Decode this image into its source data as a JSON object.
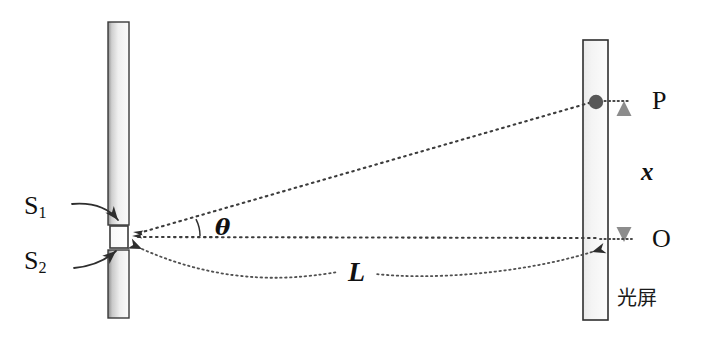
{
  "figure": {
    "kind": "optics-diagram",
    "background_color": "#ffffff",
    "ink_color": "#111111",
    "barrier_fill_light": "#f2f2f2",
    "barrier_fill_dark": "#9a9a9a",
    "barrier_stroke": "#3a3a3a",
    "ray_color": "#3c3c3c",
    "measure_arrow_color": "#8c8c8c",
    "point_dot_color": "#555555"
  },
  "labels": {
    "slit_upper": "S",
    "slit_upper_sub": "1",
    "slit_lower": "S",
    "slit_lower_sub": "2",
    "angle": "θ",
    "distance_screen": "L",
    "fringe_separation": "x",
    "point_bright": "P",
    "point_center": "O",
    "screen_name": "光屏"
  },
  "elements": {
    "barrier": {
      "name": "double-slit-barrier",
      "x_left": 108,
      "x_right": 129,
      "top": 22,
      "bottom": 318,
      "slit_gap_top": 225,
      "slit_gap_bottom": 250
    },
    "screen": {
      "name": "observation-screen",
      "x_left": 583,
      "x_right": 608,
      "top": 40,
      "bottom": 320
    },
    "source_point": {
      "x": 133,
      "y": 237
    },
    "point_P": {
      "x": 596,
      "y": 102
    },
    "point_O": {
      "x": 596,
      "y": 239
    },
    "x_arrow": {
      "x": 624,
      "y_top": 104,
      "y_bottom": 238
    },
    "L_arc": {
      "x_start": 136,
      "y_start": 246,
      "x_end": 600,
      "y_end": 246,
      "sag": 32
    }
  },
  "geometry_notes": {
    "theta_label_position": {
      "x": 215,
      "y": 216
    },
    "L_label_position": {
      "x": 352,
      "y": 268
    },
    "x_label_position": {
      "x": 640,
      "y": 158
    }
  }
}
